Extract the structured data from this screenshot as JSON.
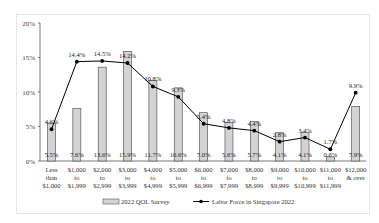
{
  "chart_data": {
    "type": "bar",
    "title": "",
    "xlabel": "",
    "ylabel": "",
    "ylim": [
      0,
      20
    ],
    "yticks": [
      "0%",
      "5%",
      "10%",
      "15%",
      "20%"
    ],
    "grid": false,
    "legend_position": "bottom",
    "categories": [
      [
        "Less",
        "than",
        "$1,000"
      ],
      [
        "$1,000",
        "to",
        "$1,999"
      ],
      [
        "$2,000",
        "to",
        "$2,999"
      ],
      [
        "$3,000",
        "to",
        "$3,999"
      ],
      [
        "$4,000",
        "to",
        "$4,999"
      ],
      [
        "$5,000",
        "to",
        "$5,999"
      ],
      [
        "$6,000",
        "to",
        "$6,999"
      ],
      [
        "$7,000",
        "to",
        "$7,999"
      ],
      [
        "$8,000",
        "to",
        "$8,999"
      ],
      [
        "$9,000",
        "to",
        "$9,999"
      ],
      [
        "$10,000",
        "to",
        "$10,999"
      ],
      [
        "$11,000",
        "to",
        "$11,999"
      ],
      [
        "$12,000",
        "& over"
      ]
    ],
    "series": [
      {
        "name": "2022 QOL Survey",
        "kind": "bar",
        "color": "#d3d3d3",
        "values": [
          5.5,
          7.6,
          13.6,
          15.9,
          11.7,
          10.6,
          7.0,
          5.6,
          5.7,
          4.1,
          4.1,
          0.6,
          7.9
        ],
        "labels": [
          "5.5%",
          "7.6%",
          "13.6%",
          "15.9%",
          "11.7%",
          "10.6%",
          "7.0%",
          "5.6%",
          "5.7%",
          "4.1%",
          "4.1%",
          "0.6%",
          "7.9%"
        ]
      },
      {
        "name": "Labor Force in Singapore 2022",
        "kind": "line",
        "color": "#000000",
        "values": [
          4.6,
          14.4,
          14.5,
          14.2,
          10.8,
          9.3,
          5.4,
          4.8,
          4.4,
          2.8,
          3.4,
          1.7,
          9.9
        ],
        "labels": [
          "4.6%",
          "14.4%",
          "14.5%",
          "14.2%",
          "10.8%",
          "9.3%",
          "5.4%",
          "4.8%",
          "4.4%",
          "2.8%",
          "3.4%",
          "1.7%",
          "9.9%"
        ]
      }
    ]
  },
  "legend": {
    "bar_label": "2022 QOL Survey",
    "line_label": "Labor Force in Singapore 2022"
  }
}
